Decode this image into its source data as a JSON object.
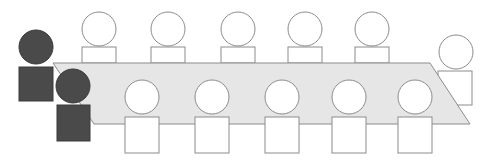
{
  "diagram": {
    "colors": {
      "background": "#ffffff",
      "table_fill": "#e6e6e6",
      "table_stroke": "#8c8c8c",
      "person_fill": "#ffffff",
      "person_stroke": "#8c8c8c",
      "highlight_fill": "#4a4a4a",
      "highlight_stroke": "#3a3a3a"
    },
    "table": {
      "shape": "parallelogram",
      "points": [
        [
          53,
          63
        ],
        [
          430,
          63
        ],
        [
          470,
          124
        ],
        [
          94,
          124
        ]
      ]
    },
    "people": [
      {
        "id": "top-1",
        "row": "top",
        "highlighted": false,
        "head": {
          "cx": 99,
          "cy": 29,
          "r": 17
        },
        "body": {
          "x": 82,
          "y": 47,
          "w": 34,
          "h": 16
        }
      },
      {
        "id": "top-2",
        "row": "top",
        "highlighted": false,
        "head": {
          "cx": 168,
          "cy": 29,
          "r": 17
        },
        "body": {
          "x": 151,
          "y": 47,
          "w": 34,
          "h": 16
        }
      },
      {
        "id": "top-3",
        "row": "top",
        "highlighted": false,
        "head": {
          "cx": 238,
          "cy": 29,
          "r": 17
        },
        "body": {
          "x": 221,
          "y": 47,
          "w": 34,
          "h": 16
        }
      },
      {
        "id": "top-4",
        "row": "top",
        "highlighted": false,
        "head": {
          "cx": 305,
          "cy": 29,
          "r": 17
        },
        "body": {
          "x": 288,
          "y": 47,
          "w": 34,
          "h": 16
        }
      },
      {
        "id": "top-5",
        "row": "top",
        "highlighted": false,
        "head": {
          "cx": 372,
          "cy": 29,
          "r": 17
        },
        "body": {
          "x": 355,
          "y": 47,
          "w": 34,
          "h": 16
        }
      },
      {
        "id": "end-right",
        "row": "end",
        "highlighted": false,
        "head": {
          "cx": 456,
          "cy": 52,
          "r": 17
        },
        "body": {
          "x": 438,
          "y": 71,
          "w": 34,
          "h": 34
        }
      },
      {
        "id": "bottom-1",
        "row": "bottom",
        "highlighted": false,
        "head": {
          "cx": 142,
          "cy": 97,
          "r": 17
        },
        "body": {
          "x": 125,
          "y": 117,
          "w": 34,
          "h": 36
        }
      },
      {
        "id": "bottom-2",
        "row": "bottom",
        "highlighted": false,
        "head": {
          "cx": 212,
          "cy": 97,
          "r": 17
        },
        "body": {
          "x": 195,
          "y": 117,
          "w": 34,
          "h": 36
        }
      },
      {
        "id": "bottom-3",
        "row": "bottom",
        "highlighted": false,
        "head": {
          "cx": 282,
          "cy": 97,
          "r": 17
        },
        "body": {
          "x": 265,
          "y": 117,
          "w": 34,
          "h": 36
        }
      },
      {
        "id": "bottom-4",
        "row": "bottom",
        "highlighted": false,
        "head": {
          "cx": 349,
          "cy": 97,
          "r": 17
        },
        "body": {
          "x": 332,
          "y": 117,
          "w": 34,
          "h": 36
        }
      },
      {
        "id": "bottom-5",
        "row": "bottom",
        "highlighted": false,
        "head": {
          "cx": 415,
          "cy": 97,
          "r": 17
        },
        "body": {
          "x": 398,
          "y": 117,
          "w": 34,
          "h": 36
        }
      },
      {
        "id": "end-left-1",
        "row": "end",
        "highlighted": true,
        "head": {
          "cx": 36,
          "cy": 47,
          "r": 17
        },
        "body": {
          "x": 19,
          "y": 67,
          "w": 34,
          "h": 34
        }
      },
      {
        "id": "end-left-2",
        "row": "end",
        "highlighted": true,
        "head": {
          "cx": 73,
          "cy": 86,
          "r": 17
        },
        "body": {
          "x": 57,
          "y": 105,
          "w": 33,
          "h": 36
        }
      }
    ]
  }
}
